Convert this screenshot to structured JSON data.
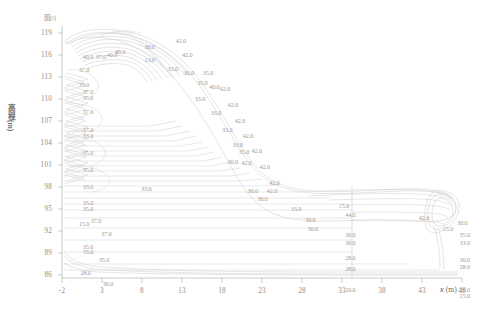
{
  "figure": {
    "corner_note": "图(l)",
    "y_axis": {
      "label": "高程(m)",
      "ticks": [
        "119",
        "116",
        "113",
        "110",
        "107",
        "104",
        "101",
        "98",
        "95",
        "92",
        "89",
        "86"
      ],
      "min": 86,
      "max": 119,
      "step": 3
    },
    "x_axis": {
      "label": "x (m)",
      "label_symbol": "x",
      "label_unit": "(m)",
      "ticks": [
        "-2",
        "3",
        "8",
        "13",
        "18",
        "23",
        "28",
        "33",
        "38",
        "43",
        "48"
      ],
      "min": -2,
      "max": 48,
      "step": 5
    }
  },
  "chart_data": {
    "type": "line",
    "title": "",
    "subtitle": "",
    "xlabel": "x (m)",
    "ylabel": "高程(m)",
    "xlim": [
      -2,
      48
    ],
    "ylim": [
      86,
      119
    ],
    "xticks": [
      -2,
      3,
      8,
      13,
      18,
      23,
      28,
      33,
      38,
      43,
      48
    ],
    "yticks": [
      119,
      116,
      113,
      110,
      107,
      104,
      101,
      98,
      95,
      92,
      89,
      86
    ],
    "grid": false,
    "legend": "none",
    "line_color": "#c9c9c9",
    "axis_color": "#b8b8b8",
    "text_color": "#9c9c9c",
    "contour_labels": [
      {
        "x": 0.6,
        "y": 115.0,
        "value": "40.0"
      },
      {
        "x": 2.2,
        "y": 115.0,
        "value": "37.0"
      },
      {
        "x": 3.6,
        "y": 115.2,
        "value": "40.0"
      },
      {
        "x": 4.6,
        "y": 115.6,
        "value": "40.0"
      },
      {
        "x": 8.3,
        "y": 116.2,
        "value": "30.0"
      },
      {
        "x": 8.3,
        "y": 114.5,
        "value": "13.0"
      },
      {
        "x": 11.2,
        "y": 113.4,
        "value": "33.0"
      },
      {
        "x": 12.2,
        "y": 117.1,
        "value": "42.0"
      },
      {
        "x": 13.0,
        "y": 115.2,
        "value": "42.0"
      },
      {
        "x": 13.2,
        "y": 112.9,
        "value": "30.0"
      },
      {
        "x": 15.6,
        "y": 112.9,
        "value": "35.0"
      },
      {
        "x": 14.9,
        "y": 111.5,
        "value": "35.0"
      },
      {
        "x": 16.4,
        "y": 111.0,
        "value": "40.0"
      },
      {
        "x": 17.7,
        "y": 110.8,
        "value": "42.0"
      },
      {
        "x": 14.6,
        "y": 109.4,
        "value": "33.0"
      },
      {
        "x": 18.7,
        "y": 108.6,
        "value": "42.0"
      },
      {
        "x": 16.6,
        "y": 107.6,
        "value": "33.0"
      },
      {
        "x": 19.6,
        "y": 106.6,
        "value": "42.0"
      },
      {
        "x": 18.0,
        "y": 105.4,
        "value": "33.0"
      },
      {
        "x": 20.6,
        "y": 104.6,
        "value": "42.0"
      },
      {
        "x": 19.3,
        "y": 103.4,
        "value": "33.0"
      },
      {
        "x": 20.1,
        "y": 102.5,
        "value": "35.0"
      },
      {
        "x": 21.7,
        "y": 102.6,
        "value": "42.0"
      },
      {
        "x": 18.7,
        "y": 101.2,
        "value": "30.0"
      },
      {
        "x": 20.4,
        "y": 101.0,
        "value": "42.0"
      },
      {
        "x": 22.7,
        "y": 100.6,
        "value": "42.0"
      },
      {
        "x": 23.9,
        "y": 98.5,
        "value": "42.0"
      },
      {
        "x": 21.2,
        "y": 97.4,
        "value": "30.0"
      },
      {
        "x": 23.6,
        "y": 97.4,
        "value": "42.0"
      },
      {
        "x": 22.4,
        "y": 96.3,
        "value": "30.0"
      },
      {
        "x": 0.1,
        "y": 113.3,
        "value": "37.0"
      },
      {
        "x": 0.1,
        "y": 111.3,
        "value": "35.0"
      },
      {
        "x": 0.6,
        "y": 110.4,
        "value": "37.0"
      },
      {
        "x": 0.6,
        "y": 109.6,
        "value": "35.0"
      },
      {
        "x": 0.6,
        "y": 107.7,
        "value": "37.0"
      },
      {
        "x": 0.6,
        "y": 105.4,
        "value": "37.0"
      },
      {
        "x": 0.6,
        "y": 104.6,
        "value": "33.0"
      },
      {
        "x": 0.6,
        "y": 102.4,
        "value": "35.0"
      },
      {
        "x": 0.6,
        "y": 100.1,
        "value": "35.0"
      },
      {
        "x": 0.6,
        "y": 97.9,
        "value": "33.0"
      },
      {
        "x": 0.6,
        "y": 95.8,
        "value": "35.0"
      },
      {
        "x": 0.6,
        "y": 95.0,
        "value": "35.0"
      },
      {
        "x": 0.1,
        "y": 93.1,
        "value": "15.0"
      },
      {
        "x": 1.6,
        "y": 93.4,
        "value": "37.0"
      },
      {
        "x": 2.9,
        "y": 91.8,
        "value": "37.0"
      },
      {
        "x": 0.6,
        "y": 90.1,
        "value": "35.0"
      },
      {
        "x": 0.6,
        "y": 89.4,
        "value": "33.0"
      },
      {
        "x": 2.6,
        "y": 88.4,
        "value": "35.0"
      },
      {
        "x": 0.3,
        "y": 86.6,
        "value": "28.0"
      },
      {
        "x": 3.1,
        "y": 85.2,
        "value": "30.0"
      },
      {
        "x": 7.9,
        "y": 97.6,
        "value": "33.0"
      },
      {
        "x": 26.6,
        "y": 95.0,
        "value": "33.0"
      },
      {
        "x": 28.4,
        "y": 93.6,
        "value": "30.0"
      },
      {
        "x": 28.7,
        "y": 92.4,
        "value": "30.0"
      },
      {
        "x": 32.6,
        "y": 95.4,
        "value": "15.0"
      },
      {
        "x": 33.4,
        "y": 94.2,
        "value": "44.0"
      },
      {
        "x": 33.4,
        "y": 91.6,
        "value": "30.0"
      },
      {
        "x": 33.4,
        "y": 90.6,
        "value": "30.0"
      },
      {
        "x": 33.4,
        "y": 88.6,
        "value": "28.0"
      },
      {
        "x": 33.4,
        "y": 87.2,
        "value": "28.0"
      },
      {
        "x": 33.4,
        "y": 84.4,
        "value": "20.0"
      },
      {
        "x": 42.6,
        "y": 93.8,
        "value": "42.0"
      },
      {
        "x": 45.6,
        "y": 92.4,
        "value": "15.0"
      },
      {
        "x": 47.4,
        "y": 93.2,
        "value": "30.0"
      },
      {
        "x": 47.7,
        "y": 91.6,
        "value": "35.0"
      },
      {
        "x": 47.7,
        "y": 90.6,
        "value": "33.0"
      },
      {
        "x": 47.7,
        "y": 88.4,
        "value": "30.0"
      },
      {
        "x": 47.7,
        "y": 87.4,
        "value": "28.0"
      },
      {
        "x": 47.7,
        "y": 84.4,
        "value": "20.0"
      },
      {
        "x": 47.7,
        "y": 83.6,
        "value": "15.0"
      }
    ]
  }
}
